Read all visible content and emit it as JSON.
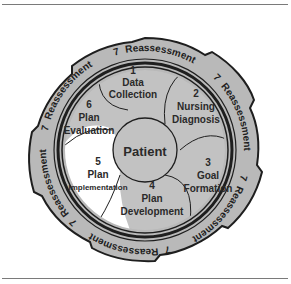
{
  "diagram": {
    "center": {
      "label": "Patient"
    },
    "steps": [
      {
        "number": "1",
        "line1": "Data",
        "line2": "Collection"
      },
      {
        "number": "2",
        "line1": "Nursing",
        "line2": "Diagnosis"
      },
      {
        "number": "3",
        "line1": "Goal",
        "line2": "Formation"
      },
      {
        "number": "4",
        "line1": "Plan",
        "line2": "Development"
      },
      {
        "number": "5",
        "line1": "Plan",
        "line2": "Implementation"
      },
      {
        "number": "6",
        "line1": "Plan",
        "line2": "Evaluation"
      }
    ],
    "outer_ring": {
      "number": "7",
      "label": "Reassessment",
      "repeat_count": 6
    },
    "colors": {
      "segment_fill": "#c2c2c2",
      "highlight_fill": "#ffffff",
      "ring_fill": "#b9b9b9",
      "outline": "#1e1e1e",
      "rule": "#7a7a7a"
    }
  }
}
